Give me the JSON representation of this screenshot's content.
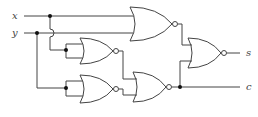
{
  "diagram": {
    "type": "logic-circuit",
    "inputs": [
      {
        "id": "x",
        "label": "x"
      },
      {
        "id": "y",
        "label": "y"
      }
    ],
    "outputs": [
      {
        "id": "s",
        "label": "s"
      },
      {
        "id": "c",
        "label": "c"
      }
    ],
    "gates": [
      {
        "id": "g1",
        "type": "NOR",
        "inputs": [
          "x",
          "y"
        ]
      },
      {
        "id": "g2",
        "type": "NOR",
        "inputs": [
          "x",
          "x"
        ]
      },
      {
        "id": "g3",
        "type": "NOR",
        "inputs": [
          "y",
          "y"
        ]
      },
      {
        "id": "g4",
        "type": "NOR",
        "inputs": [
          "g2",
          "g3"
        ],
        "output": "c"
      },
      {
        "id": "g5",
        "type": "NOR",
        "inputs": [
          "g1",
          "g4"
        ],
        "output": "s"
      }
    ],
    "colors": {
      "line": "#444444",
      "junction": "#111111",
      "background": "#ffffff"
    }
  }
}
